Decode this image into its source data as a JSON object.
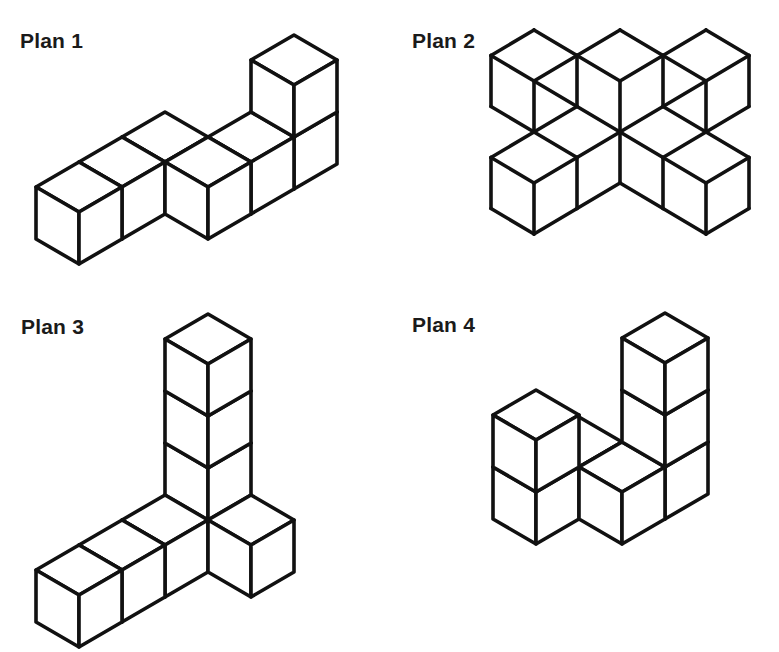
{
  "page": {
    "background": "#ffffff",
    "line_color": "#111111"
  },
  "projection": {
    "edge_dx": 43,
    "edge_dy": 25,
    "cube_height": 52
  },
  "plans": [
    {
      "label": "Plan 1",
      "label_pos": [
        20,
        30
      ],
      "render": "cubes",
      "origin": [
        79,
        162
      ],
      "cubes": [
        [
          0,
          0,
          0
        ],
        [
          -1,
          0,
          0
        ],
        [
          -2,
          0,
          0
        ],
        [
          -2,
          1,
          0
        ],
        [
          -3,
          1,
          0
        ],
        [
          -4,
          1,
          0
        ],
        [
          -4,
          1,
          1
        ]
      ],
      "cube_count": 7
    },
    {
      "label": "Plan 2",
      "label_pos": [
        412,
        30
      ],
      "render": "segments",
      "origin": [
        620,
        30
      ],
      "lattice": {
        "dx": 43,
        "dy": 25.5
      },
      "segments": [
        [
          -2,
          0,
          -3,
          1
        ],
        [
          -2,
          0,
          -1,
          1
        ],
        [
          -3,
          1,
          -2,
          2
        ],
        [
          -2,
          2,
          -1,
          1
        ],
        [
          -3,
          1,
          -3,
          3
        ],
        [
          -2,
          2,
          -2,
          4
        ],
        [
          -3,
          3,
          -2,
          4
        ],
        [
          -1,
          1,
          -1,
          3
        ],
        [
          -2,
          2,
          -1,
          3
        ],
        [
          -1,
          3,
          -2,
          4
        ],
        [
          0,
          0,
          -1,
          1
        ],
        [
          0,
          0,
          1,
          1
        ],
        [
          -1,
          1,
          0,
          2
        ],
        [
          0,
          2,
          1,
          1
        ],
        [
          0,
          2,
          0,
          4
        ],
        [
          -1,
          3,
          0,
          4
        ],
        [
          1,
          3,
          0,
          4
        ],
        [
          2,
          0,
          1,
          1
        ],
        [
          2,
          0,
          3,
          1
        ],
        [
          1,
          1,
          2,
          2
        ],
        [
          2,
          2,
          3,
          1
        ],
        [
          3,
          1,
          3,
          3
        ],
        [
          2,
          2,
          2,
          4
        ],
        [
          3,
          3,
          2,
          4
        ],
        [
          1,
          1,
          1,
          3
        ],
        [
          2,
          2,
          1,
          3
        ],
        [
          1,
          3,
          2,
          4
        ],
        [
          -2,
          4,
          -1,
          5
        ],
        [
          -1,
          5,
          0,
          4
        ],
        [
          2,
          4,
          1,
          5
        ],
        [
          1,
          5,
          0,
          4
        ],
        [
          0,
          4,
          0,
          6
        ],
        [
          0,
          6,
          -1,
          7
        ],
        [
          0,
          6,
          1,
          7
        ],
        [
          -2,
          4,
          -3,
          5
        ],
        [
          -3,
          5,
          -2,
          6
        ],
        [
          -2,
          6,
          -1,
          5
        ],
        [
          -3,
          5,
          -3,
          7
        ],
        [
          -2,
          6,
          -2,
          8
        ],
        [
          -1,
          5,
          -1,
          7
        ],
        [
          -3,
          7,
          -2,
          8
        ],
        [
          -2,
          8,
          -1,
          7
        ],
        [
          2,
          4,
          3,
          5
        ],
        [
          3,
          5,
          2,
          6
        ],
        [
          2,
          6,
          1,
          5
        ],
        [
          3,
          5,
          3,
          7
        ],
        [
          2,
          6,
          2,
          8
        ],
        [
          1,
          5,
          1,
          7
        ],
        [
          3,
          7,
          2,
          8
        ],
        [
          2,
          8,
          1,
          7
        ]
      ]
    },
    {
      "label": "Plan 3",
      "label_pos": [
        21,
        316
      ],
      "render": "cubes",
      "origin": [
        208,
        470
      ],
      "cubes": [
        [
          0,
          0,
          0
        ],
        [
          0,
          0,
          1
        ],
        [
          0,
          0,
          2
        ],
        [
          0,
          0,
          3
        ],
        [
          1,
          0,
          0
        ],
        [
          2,
          0,
          0
        ],
        [
          3,
          0,
          0
        ],
        [
          0,
          1,
          0
        ]
      ],
      "cube_count": 8
    },
    {
      "label": "Plan 4",
      "label_pos": [
        412,
        314
      ],
      "render": "cubes",
      "origin": [
        536,
        442
      ],
      "cubes": [
        [
          0,
          0,
          0
        ],
        [
          0,
          0,
          1
        ],
        [
          -1,
          0,
          0
        ],
        [
          -1,
          1,
          0
        ],
        [
          -2,
          1,
          0
        ],
        [
          -2,
          1,
          1
        ],
        [
          -2,
          1,
          2
        ]
      ],
      "cube_count": 7
    }
  ]
}
